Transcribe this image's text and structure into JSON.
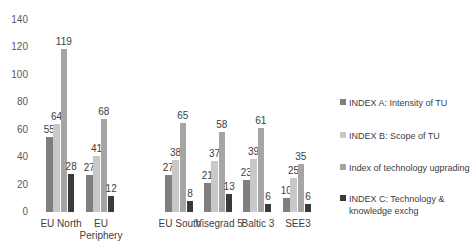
{
  "chart_data": {
    "type": "bar",
    "title": "",
    "xlabel": "",
    "ylabel": "",
    "ylim": [
      0,
      140
    ],
    "yticks": [
      0,
      20,
      40,
      60,
      80,
      100,
      120,
      140
    ],
    "grid": false,
    "legend_position": "right",
    "categories": [
      "EU North",
      "EU Periphery",
      "EU South",
      "Visegrad 5",
      "Baltic 3",
      "SEE3"
    ],
    "series": [
      {
        "name": "INDEX A: Intensity of TU",
        "color": "#7f7f7f",
        "values": [
          55,
          27,
          27,
          21,
          23,
          10
        ]
      },
      {
        "name": "INDEX B: Scope of TU",
        "color": "#c8c8c8",
        "values": [
          64,
          41,
          38,
          37,
          39,
          25
        ]
      },
      {
        "name": "Index of technology ugprading",
        "color": "#a5a5a5",
        "values": [
          119,
          68,
          65,
          58,
          61,
          35
        ]
      },
      {
        "name": "INDEX C: Technology & knowledge exchg",
        "color": "#3a3a3a",
        "values": [
          28,
          12,
          8,
          13,
          6,
          6
        ]
      }
    ]
  },
  "layout": {
    "category_labels": [
      [
        "EU North"
      ],
      [
        "EU",
        "Periphery"
      ],
      [
        "EU South"
      ],
      [
        "Visegrad 5"
      ],
      [
        "Baltic 3"
      ],
      [
        "SEE3"
      ]
    ],
    "legend_labels": [
      [
        "INDEX A: Intensity of TU"
      ],
      [
        "INDEX B: Scope of TU"
      ],
      [
        "Index of technology ugprading"
      ],
      [
        "INDEX C: Technology &",
        "knowledge exchg"
      ]
    ]
  }
}
